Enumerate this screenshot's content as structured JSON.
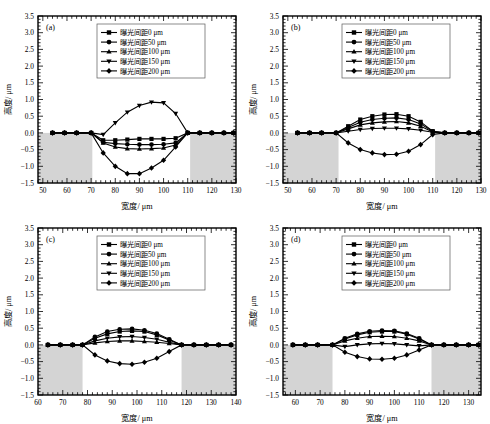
{
  "figure": {
    "panels_count": 4,
    "legend_entries": [
      {
        "label": "曝光间距0 μm",
        "marker": "square"
      },
      {
        "label": "曝光间距50 μm",
        "marker": "circle"
      },
      {
        "label": "曝光间距100 μm",
        "marker": "triangle-up"
      },
      {
        "label": "曝光间距150 μm",
        "marker": "triangle-down"
      },
      {
        "label": "曝光间距200 μm",
        "marker": "diamond"
      }
    ],
    "y_ticks": [
      "3.5",
      "3.0",
      "2.5",
      "2.0",
      "1.5",
      "1.0",
      "0.5",
      "0.0",
      "-0.5",
      "-1.0",
      "-1.5"
    ],
    "xlabel": "宽度/ μm",
    "ylabel": "高度/ μm",
    "shade_color": "#d4d4d4",
    "line_color": "#000000"
  },
  "chart_data": [
    {
      "type": "line",
      "panel": "(a)",
      "title": "",
      "xlabel": "宽度/ μm",
      "ylabel": "高度/ μm",
      "xlim": [
        48,
        130
      ],
      "ylim": [
        -1.5,
        3.5
      ],
      "xticks": [
        50,
        60,
        70,
        80,
        90,
        100,
        110,
        120,
        130
      ],
      "yticks": [
        -1.5,
        -1.0,
        -0.5,
        0.0,
        0.5,
        1.0,
        1.5,
        2.0,
        2.5,
        3.0,
        3.5
      ],
      "grid": false,
      "legend_position": "upper-center",
      "shaded_regions": [
        [
          48,
          70.5
        ],
        [
          111,
          130
        ]
      ],
      "x": [
        54,
        59,
        64,
        70,
        75,
        80,
        85,
        90,
        95,
        100,
        105,
        110,
        115,
        120,
        125,
        129
      ],
      "series": [
        {
          "name": "曝光间距0 μm",
          "marker": "square",
          "values": [
            0.0,
            0.0,
            0.0,
            0.0,
            -0.22,
            -0.22,
            -0.2,
            -0.18,
            -0.18,
            -0.18,
            -0.16,
            0.0,
            0.0,
            0.0,
            0.0,
            0.0
          ]
        },
        {
          "name": "曝光间距50 μm",
          "marker": "circle",
          "values": [
            0.0,
            0.0,
            0.0,
            0.0,
            -0.28,
            -0.32,
            -0.34,
            -0.35,
            -0.35,
            -0.34,
            -0.3,
            0.0,
            0.0,
            0.0,
            0.0,
            0.0
          ]
        },
        {
          "name": "曝光间距100 μm",
          "marker": "triangle-up",
          "values": [
            0.0,
            0.0,
            0.0,
            0.0,
            -0.3,
            -0.42,
            -0.47,
            -0.48,
            -0.47,
            -0.45,
            -0.36,
            0.0,
            0.0,
            0.0,
            0.0,
            0.0
          ]
        },
        {
          "name": "曝光间距150 μm",
          "marker": "triangle-down",
          "values": [
            0.0,
            0.0,
            0.0,
            0.0,
            -0.05,
            0.3,
            0.62,
            0.82,
            0.92,
            0.9,
            0.58,
            0.0,
            0.0,
            0.0,
            0.0,
            0.0
          ]
        },
        {
          "name": "曝光间距200 μm",
          "marker": "diamond",
          "values": [
            0.0,
            0.0,
            0.0,
            0.0,
            -0.6,
            -1.0,
            -1.22,
            -1.22,
            -1.05,
            -0.82,
            -0.42,
            0.0,
            0.0,
            0.0,
            0.0,
            0.0
          ]
        }
      ]
    },
    {
      "type": "line",
      "panel": "(b)",
      "title": "",
      "xlabel": "宽度/ μm",
      "ylabel": "高度/ μm",
      "xlim": [
        48,
        130
      ],
      "ylim": [
        -1.5,
        3.5
      ],
      "xticks": [
        50,
        60,
        70,
        80,
        90,
        100,
        110,
        120,
        130
      ],
      "yticks": [
        -1.5,
        -1.0,
        -0.5,
        0.0,
        0.5,
        1.0,
        1.5,
        2.0,
        2.5,
        3.0,
        3.5
      ],
      "grid": false,
      "legend_position": "upper-center",
      "shaded_regions": [
        [
          48,
          71
        ],
        [
          111,
          130
        ]
      ],
      "x": [
        54,
        59,
        64,
        70,
        75,
        80,
        85,
        90,
        95,
        100,
        105,
        110,
        115,
        120,
        125,
        129
      ],
      "series": [
        {
          "name": "曝光间距0 μm",
          "marker": "square",
          "values": [
            0.0,
            0.0,
            0.0,
            0.0,
            0.2,
            0.4,
            0.5,
            0.55,
            0.56,
            0.5,
            0.33,
            0.05,
            0.0,
            0.0,
            0.0,
            0.0
          ]
        },
        {
          "name": "曝光间距50 μm",
          "marker": "circle",
          "values": [
            0.0,
            0.0,
            0.0,
            0.0,
            0.16,
            0.32,
            0.4,
            0.44,
            0.45,
            0.4,
            0.27,
            0.04,
            0.0,
            0.0,
            0.0,
            0.0
          ]
        },
        {
          "name": "曝光间距100 μm",
          "marker": "triangle-up",
          "values": [
            0.0,
            0.0,
            0.0,
            0.0,
            0.12,
            0.24,
            0.3,
            0.33,
            0.34,
            0.3,
            0.2,
            0.03,
            0.0,
            0.0,
            0.0,
            0.0
          ]
        },
        {
          "name": "曝光间距150 μm",
          "marker": "triangle-down",
          "values": [
            0.0,
            0.0,
            0.0,
            0.0,
            0.05,
            0.1,
            0.13,
            0.14,
            0.14,
            0.12,
            0.08,
            0.02,
            0.0,
            0.0,
            0.0,
            0.0
          ]
        },
        {
          "name": "曝光间距200 μm",
          "marker": "diamond",
          "values": [
            0.0,
            0.0,
            0.0,
            0.0,
            -0.3,
            -0.5,
            -0.6,
            -0.65,
            -0.64,
            -0.55,
            -0.35,
            -0.05,
            0.0,
            0.0,
            0.0,
            0.0
          ]
        }
      ]
    },
    {
      "type": "line",
      "panel": "(c)",
      "title": "",
      "xlabel": "宽度/ μm",
      "ylabel": "高度/ μm",
      "xlim": [
        60,
        140
      ],
      "ylim": [
        -1.5,
        3.5
      ],
      "xticks": [
        60,
        70,
        80,
        90,
        100,
        110,
        120,
        130,
        140
      ],
      "yticks": [
        -1.5,
        -1.0,
        -0.5,
        0.0,
        0.5,
        1.0,
        1.5,
        2.0,
        2.5,
        3.0,
        3.5
      ],
      "grid": false,
      "legend_position": "upper-center",
      "shaded_regions": [
        [
          60,
          78
        ],
        [
          118,
          140
        ]
      ],
      "x": [
        64,
        69,
        74,
        78,
        83,
        88,
        93,
        98,
        103,
        108,
        113,
        118,
        123,
        128,
        133,
        138
      ],
      "series": [
        {
          "name": "曝光间距0 μm",
          "marker": "square",
          "values": [
            0.0,
            0.0,
            0.0,
            0.0,
            0.2,
            0.33,
            0.4,
            0.42,
            0.4,
            0.3,
            0.15,
            0.0,
            0.0,
            0.0,
            0.0,
            0.0
          ]
        },
        {
          "name": "曝光间距50 μm",
          "marker": "circle",
          "values": [
            0.0,
            0.0,
            0.0,
            0.0,
            0.24,
            0.4,
            0.47,
            0.48,
            0.44,
            0.34,
            0.17,
            0.0,
            0.0,
            0.0,
            0.0,
            0.0
          ]
        },
        {
          "name": "曝光间距100 μm",
          "marker": "triangle-up",
          "values": [
            0.0,
            0.0,
            0.0,
            0.0,
            0.06,
            0.1,
            0.12,
            0.12,
            0.1,
            0.08,
            0.04,
            0.0,
            0.0,
            0.0,
            0.0,
            0.0
          ]
        },
        {
          "name": "曝光间距150 μm",
          "marker": "triangle-down",
          "values": [
            0.0,
            0.0,
            0.0,
            0.0,
            0.12,
            0.2,
            0.24,
            0.25,
            0.22,
            0.17,
            0.08,
            0.0,
            0.0,
            0.0,
            0.0,
            0.0
          ]
        },
        {
          "name": "曝光间距200 μm",
          "marker": "diamond",
          "values": [
            0.0,
            0.0,
            0.0,
            0.0,
            -0.3,
            -0.48,
            -0.56,
            -0.58,
            -0.52,
            -0.4,
            -0.2,
            0.0,
            0.0,
            0.0,
            0.0,
            0.0
          ]
        }
      ]
    },
    {
      "type": "line",
      "panel": "(d)",
      "title": "",
      "xlabel": "宽度/ μm",
      "ylabel": "高度/ μm",
      "xlim": [
        55,
        135
      ],
      "ylim": [
        -1.5,
        3.5
      ],
      "xticks": [
        60,
        70,
        80,
        90,
        100,
        110,
        120,
        130
      ],
      "yticks": [
        -1.5,
        -1.0,
        -0.5,
        0.0,
        0.5,
        1.0,
        1.5,
        2.0,
        2.5,
        3.0,
        3.5
      ],
      "grid": false,
      "legend_position": "upper-center",
      "shaded_regions": [
        [
          55,
          75
        ],
        [
          115,
          135
        ]
      ],
      "x": [
        59,
        64,
        69,
        75,
        80,
        85,
        90,
        95,
        100,
        105,
        110,
        115,
        120,
        125,
        130,
        134
      ],
      "series": [
        {
          "name": "曝光间距0 μm",
          "marker": "square",
          "values": [
            0.0,
            0.0,
            0.0,
            0.0,
            0.18,
            0.3,
            0.38,
            0.4,
            0.4,
            0.32,
            0.18,
            0.0,
            0.0,
            0.0,
            0.0,
            0.0
          ]
        },
        {
          "name": "曝光间距50 μm",
          "marker": "circle",
          "values": [
            0.0,
            0.0,
            0.0,
            0.0,
            0.2,
            0.33,
            0.41,
            0.43,
            0.42,
            0.34,
            0.2,
            0.0,
            0.0,
            0.0,
            0.0,
            0.0
          ]
        },
        {
          "name": "曝光间距100 μm",
          "marker": "triangle-up",
          "values": [
            0.0,
            0.0,
            0.0,
            0.0,
            0.12,
            0.2,
            0.25,
            0.26,
            0.25,
            0.2,
            0.12,
            0.0,
            0.0,
            0.0,
            0.0,
            0.0
          ]
        },
        {
          "name": "曝光间距150 μm",
          "marker": "triangle-down",
          "values": [
            0.0,
            0.0,
            0.0,
            0.0,
            -0.05,
            0.0,
            0.03,
            0.04,
            0.03,
            0.0,
            -0.03,
            0.0,
            0.0,
            0.0,
            0.0,
            0.0
          ]
        },
        {
          "name": "曝光间距200 μm",
          "marker": "diamond",
          "values": [
            0.0,
            0.0,
            0.0,
            0.0,
            -0.22,
            -0.35,
            -0.42,
            -0.43,
            -0.4,
            -0.3,
            -0.15,
            0.0,
            0.0,
            0.0,
            0.0,
            0.0
          ]
        }
      ]
    }
  ]
}
